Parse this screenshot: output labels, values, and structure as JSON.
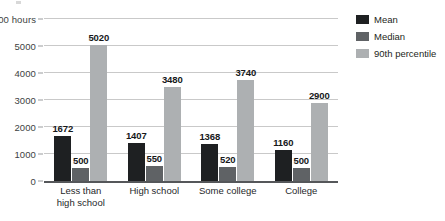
{
  "chart_data": {
    "type": "bar",
    "title": "",
    "xlabel": "",
    "ylabel": "hours",
    "ylim": [
      0,
      6000
    ],
    "ytick_values": [
      0,
      1000,
      2000,
      3000,
      4000,
      5000,
      6000
    ],
    "ytick_labels": [
      "0",
      "1000",
      "2000",
      "3000",
      "4000",
      "5000",
      "6000 hours"
    ],
    "grid": true,
    "legend_position": "right",
    "categories": [
      "Less than high school",
      "High school",
      "Some college",
      "College"
    ],
    "category_lines": [
      [
        "Less than",
        "high school"
      ],
      [
        "High school"
      ],
      [
        "Some college"
      ],
      [
        "College"
      ]
    ],
    "series": [
      {
        "name": "Mean",
        "color": "#1e2022",
        "values": [
          1672,
          1407,
          1368,
          1160
        ],
        "labels": [
          "1672",
          "1407",
          "1368",
          "1160"
        ]
      },
      {
        "name": "Median",
        "color": "#5f6265",
        "values": [
          500,
          550,
          520,
          500
        ],
        "labels": [
          "500",
          "550",
          "520",
          "500"
        ]
      },
      {
        "name": "90th percentile",
        "color": "#adb0b2",
        "values": [
          5020,
          3480,
          3740,
          2900
        ],
        "labels": [
          "5020",
          "3480",
          "3740",
          "2900"
        ]
      }
    ]
  },
  "legend": {
    "items": [
      {
        "label": "Mean",
        "color": "#1e2022"
      },
      {
        "label": "Median",
        "color": "#5f6265"
      },
      {
        "label": "90th percentile",
        "color": "#adb0b2"
      }
    ]
  },
  "axis": {
    "unit_suffix": "hours"
  }
}
